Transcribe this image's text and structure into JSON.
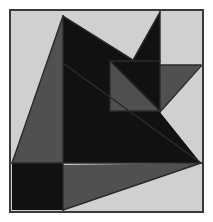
{
  "figure": {
    "type": "abstract-polygon-mosaic",
    "width": 213,
    "height": 222,
    "page_background": "#ffffff",
    "frame": {
      "x": 11,
      "y": 11,
      "width": 191,
      "height": 200,
      "border_color": "#3a3a3a",
      "border_width": 2,
      "fill": "#d0d0d0"
    },
    "palette": {
      "light_gray": "#d0d0d0",
      "medium_gray": "#505050",
      "dark": "#111111",
      "outline": "#2a2a2a",
      "frame_border": "#3a3a3a"
    },
    "shapes": [
      {
        "name": "left-gray-triangle",
        "fill": "#505050",
        "points": "63,16 63,163 12,163"
      },
      {
        "name": "upper-left-dark-triangle",
        "fill": "#111111",
        "points": "63,16 133,60 133,110 63,110"
      },
      {
        "name": "upper-right-dark-triangle",
        "fill": "#111111",
        "points": "133,60 160,12 160,110 133,110"
      },
      {
        "name": "top-right-light-square",
        "fill": "#d0d0d0",
        "points": "160,12 201,12 201,65 160,65"
      },
      {
        "name": "right-gray-triangle",
        "fill": "#505050",
        "points": "160,65 201,65 160,112"
      },
      {
        "name": "inner-square-lower-gray-half",
        "fill": "#505050",
        "points": "110,61 160,111 110,111"
      },
      {
        "name": "inner-square-upper-dark-half",
        "fill": "#111111",
        "points": "110,61 160,61 160,111"
      },
      {
        "name": "central-dark-mass",
        "fill": "#111111",
        "points": "63,63 160,112 201,163 63,163"
      },
      {
        "name": "right-light-wedge",
        "fill": "#d0d0d0",
        "points": "160,112 201,67 201,163"
      },
      {
        "name": "bottom-left-dark-square",
        "fill": "#111111",
        "points": "12,163 63,163 63,210 12,210"
      },
      {
        "name": "bottom-right-gray-wedge",
        "fill": "#505050",
        "points": "63,165 201,163 63,210"
      }
    ],
    "edges": [
      {
        "name": "left-triangle-hypotenuse",
        "x1": 63,
        "y1": 16,
        "x2": 12,
        "y2": 163
      },
      {
        "name": "left-vertical-divider",
        "x1": 63,
        "y1": 16,
        "x2": 63,
        "y2": 210
      },
      {
        "name": "notch-left-slope",
        "x1": 63,
        "y1": 16,
        "x2": 133,
        "y2": 60
      },
      {
        "name": "notch-right-slope",
        "x1": 133,
        "y1": 60,
        "x2": 160,
        "y2": 12
      },
      {
        "name": "inner-square-top",
        "x1": 110,
        "y1": 61,
        "x2": 160,
        "y2": 61
      },
      {
        "name": "inner-square-left",
        "x1": 110,
        "y1": 61,
        "x2": 110,
        "y2": 111
      },
      {
        "name": "inner-square-bottom",
        "x1": 110,
        "y1": 111,
        "x2": 160,
        "y2": 111
      },
      {
        "name": "inner-square-diagonal",
        "x1": 110,
        "y1": 61,
        "x2": 160,
        "y2": 111
      },
      {
        "name": "right-square-left-edge",
        "x1": 160,
        "y1": 12,
        "x2": 160,
        "y2": 112
      },
      {
        "name": "right-square-bottom-edge",
        "x1": 160,
        "y1": 65,
        "x2": 201,
        "y2": 65
      },
      {
        "name": "right-gray-triangle-hypotenuse",
        "x1": 201,
        "y1": 66,
        "x2": 160,
        "y2": 112
      },
      {
        "name": "central-long-diagonal",
        "x1": 63,
        "y1": 63,
        "x2": 201,
        "y2": 163
      },
      {
        "name": "mid-horizontal-divider",
        "x1": 12,
        "y1": 163,
        "x2": 201,
        "y2": 163
      },
      {
        "name": "bottom-wedge-hypotenuse",
        "x1": 201,
        "y1": 163,
        "x2": 63,
        "y2": 210
      }
    ]
  }
}
